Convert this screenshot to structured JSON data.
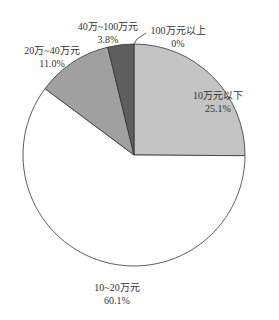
{
  "chart_data": {
    "type": "pie",
    "title": "",
    "categories": [
      "10万元以下",
      "10~20万元",
      "20万~40万元",
      "40万~100万元",
      "100万元以上"
    ],
    "values": [
      25.1,
      60.1,
      11.0,
      3.8,
      0
    ],
    "value_labels": [
      "25.1%",
      "60.1%",
      "11.0%",
      "3.8%",
      "0%"
    ],
    "colors": [
      "#c4c4c4",
      "#ffffff",
      "#a0a0a0",
      "#5e5e5e",
      "#000000"
    ],
    "start_angle_deg": 0,
    "direction": "clockwise_from_top",
    "legend": "none (inline labels)"
  },
  "labels": [
    {
      "name": "10万元以下",
      "pct": "25.1%"
    },
    {
      "name": "10~20万元",
      "pct": "60.1%"
    },
    {
      "name": "20万~40万元",
      "pct": "11.0%"
    },
    {
      "name": "40万~100万元",
      "pct": "3.8%"
    },
    {
      "name": "100万元以上",
      "pct": "0%"
    }
  ]
}
